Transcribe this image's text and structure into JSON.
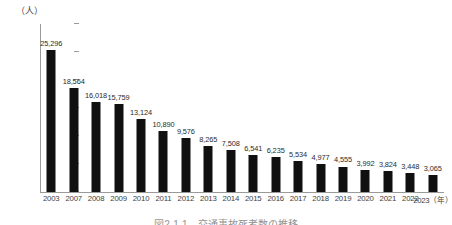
{
  "chart_data": {
    "type": "bar",
    "title": "",
    "caption": "図2-1-1　交通事故死者数の推移",
    "xlabel": "(年)",
    "ylabel": "(人)",
    "ylim": [
      0,
      30000
    ],
    "ytick_labels": [
      "0",
      "5,000",
      "10,000",
      "15,000",
      "20,000",
      "25,000",
      "30,000"
    ],
    "ytick_values": [
      0,
      5000,
      10000,
      15000,
      20000,
      25000,
      30000
    ],
    "grid": false,
    "legend": "none",
    "bar_color": "#101010",
    "categories": [
      "2003",
      "2007",
      "2008",
      "2009",
      "2010",
      "2011",
      "2012",
      "2013",
      "2014",
      "2015",
      "2016",
      "2017",
      "2018",
      "2019",
      "2020",
      "2021",
      "2022",
      "2023"
    ],
    "values": [
      25296,
      18564,
      16018,
      15759,
      13124,
      10890,
      9576,
      8265,
      7508,
      6541,
      6235,
      5534,
      4977,
      4555,
      3992,
      3824,
      3448,
      3065
    ],
    "value_labels": [
      "25,296",
      "18,564",
      "16,018",
      "15,759",
      "13,124",
      "10,890",
      "9,576",
      "8,265",
      "7,508",
      "6,541",
      "6,235",
      "5,534",
      "4,977",
      "4,555",
      "3,992",
      "3,824",
      "3,448",
      "3,065"
    ]
  },
  "axis": {
    "unit_top_left": "（人）",
    "year_suffix": "（年）"
  }
}
